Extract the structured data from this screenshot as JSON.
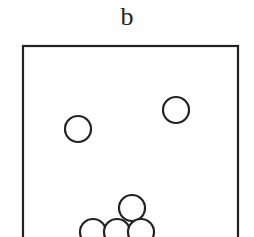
{
  "panel": {
    "label": "b",
    "stroke_color": "#222222",
    "box": {
      "x": 23,
      "y": 46,
      "width": 215,
      "height": 200
    },
    "particles": [
      {
        "cx": 78,
        "cy": 129,
        "r": 13
      },
      {
        "cx": 176,
        "cy": 110,
        "r": 13
      },
      {
        "cx": 132,
        "cy": 208,
        "r": 13
      },
      {
        "cx": 93,
        "cy": 232,
        "r": 13
      },
      {
        "cx": 117,
        "cy": 232,
        "r": 13
      },
      {
        "cx": 141,
        "cy": 232,
        "r": 13
      }
    ]
  }
}
